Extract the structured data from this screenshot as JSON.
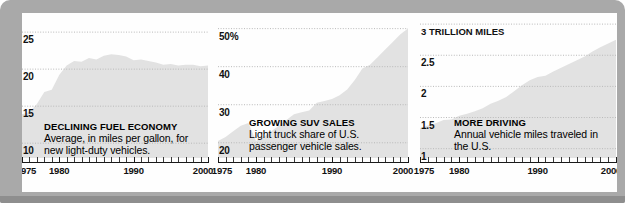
{
  "figure": {
    "frame_color": "#a9a9a9",
    "plate_color": "#fefefe",
    "area_fill_color": "#e2e2e2",
    "gridline_color": "#b9b9b9",
    "axis_color": "#1a1a1a"
  },
  "chart_data": [
    {
      "type": "area",
      "title": "DECLINING FUEL ECONOMY",
      "subtitle": "Average, in miles per gallon, for new light-duty vehicles.",
      "xlabel": "",
      "ylabel": "",
      "xlim": [
        1975,
        2000
      ],
      "ylim": [
        8,
        26.5
      ],
      "grid": true,
      "legend": "none",
      "yticks": [
        25,
        20,
        15,
        10
      ],
      "ytick_labels": [
        "25",
        "20",
        "15",
        "10"
      ],
      "xticks": [
        1975,
        1980,
        1990,
        2000
      ],
      "xtick_labels": [
        "1975",
        "1980",
        "1990",
        "2000"
      ],
      "x": [
        1975,
        1976,
        1977,
        1978,
        1979,
        1980,
        1981,
        1982,
        1983,
        1984,
        1985,
        1986,
        1987,
        1988,
        1989,
        1990,
        1991,
        1992,
        1993,
        1994,
        1995,
        1996,
        1997,
        1998,
        1999,
        2000
      ],
      "values": [
        13.9,
        14.2,
        15.3,
        16.9,
        17.2,
        19.2,
        20.5,
        21.1,
        21.0,
        21.5,
        21.3,
        21.8,
        22.0,
        21.9,
        21.7,
        21.2,
        21.3,
        21.1,
        20.9,
        20.6,
        20.7,
        20.5,
        20.6,
        20.6,
        20.4,
        20.5
      ],
      "units": "miles per gallon"
    },
    {
      "type": "area",
      "title": "GROWING SUV SALES",
      "subtitle": "Light truck share of U.S. passenger vehicle sales.",
      "xlabel": "",
      "ylabel": "",
      "xlim": [
        1975,
        2000
      ],
      "ylim": [
        16,
        52
      ],
      "grid": true,
      "legend": "none",
      "yticks": [
        50,
        40,
        30,
        20
      ],
      "ytick_labels": [
        "50%",
        "40",
        "30",
        "20"
      ],
      "xticks": [
        1975,
        1980,
        1990,
        2000
      ],
      "xtick_labels": [
        "1975",
        "1980",
        "1990",
        "2000"
      ],
      "x": [
        1975,
        1976,
        1977,
        1978,
        1979,
        1980,
        1981,
        1982,
        1983,
        1984,
        1985,
        1986,
        1987,
        1988,
        1989,
        1990,
        1991,
        1992,
        1993,
        1994,
        1995,
        1996,
        1997,
        1998,
        1999,
        2000
      ],
      "values": [
        20.5,
        21.5,
        23.0,
        24.5,
        25.2,
        20.5,
        21.5,
        23.0,
        24.5,
        26.0,
        27.5,
        28.0,
        28.5,
        30.5,
        31.0,
        31.5,
        32.5,
        34.0,
        36.5,
        39.5,
        40.5,
        42.5,
        44.5,
        46.5,
        48.5,
        50.0
      ],
      "units": "percent share"
    },
    {
      "type": "area",
      "title": "MORE DRIVING",
      "subtitle": "Annual vehicle miles traveled in the U.S.",
      "xlabel": "",
      "ylabel": "",
      "xlim": [
        1975,
        2000
      ],
      "ylim": [
        0.85,
        3.05
      ],
      "grid": true,
      "legend": "none",
      "yticks": [
        3,
        2.5,
        2,
        1.5,
        1
      ],
      "ytick_labels": [
        "3 TRILLION MILES",
        "2.5",
        "2",
        "1.5",
        "1"
      ],
      "xticks": [
        1975,
        1980,
        1990,
        2000
      ],
      "xtick_labels": [
        "1975",
        "1980",
        "1990",
        "2000"
      ],
      "x": [
        1975,
        1976,
        1977,
        1978,
        1979,
        1980,
        1981,
        1982,
        1983,
        1984,
        1985,
        1986,
        1987,
        1988,
        1989,
        1990,
        1991,
        1992,
        1993,
        1994,
        1995,
        1996,
        1997,
        1998,
        1999,
        2000
      ],
      "values": [
        1.33,
        1.37,
        1.41,
        1.46,
        1.47,
        1.53,
        1.56,
        1.6,
        1.65,
        1.72,
        1.77,
        1.83,
        1.92,
        2.02,
        2.1,
        2.15,
        2.17,
        2.24,
        2.3,
        2.36,
        2.42,
        2.48,
        2.56,
        2.63,
        2.69,
        2.75
      ],
      "units": "trillion miles"
    }
  ],
  "panels": [
    {
      "id": "fuel-economy",
      "title": "DECLINING FUEL ECONOMY",
      "body": "Average, in miles per gallon, for new light-duty vehicles."
    },
    {
      "id": "suv-sales",
      "title": "GROWING SUV SALES",
      "body": "Light truck share of U.S. passenger vehicle sales."
    },
    {
      "id": "more-driving",
      "title": "MORE DRIVING",
      "body": "Annual vehicle miles traveled in the U.S."
    }
  ]
}
